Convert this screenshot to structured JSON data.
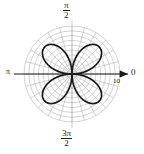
{
  "figure": {
    "type": "polar-plot",
    "background_color": "#ffffff",
    "curve_color": "#1a1a1a",
    "grid_color": "#b0b0b0",
    "axis_color": "#1a1a1a"
  },
  "labels": {
    "top_numerator": "π",
    "top_denominator": "2",
    "bottom_numerator": "3π",
    "bottom_denominator": "2",
    "left": "π",
    "right_angle": "0",
    "radial_tick": "10"
  },
  "chart_data": {
    "type": "line",
    "title": "",
    "subtitle": "",
    "xlabel": "",
    "ylabel": "",
    "coordinate_system": "polar",
    "grid": true,
    "legend": null,
    "angle_tick_labels": [
      "0",
      "π/2",
      "π",
      "3π/2"
    ],
    "angle_tick_values_rad": [
      0,
      1.5707963,
      3.1415927,
      4.712389
    ],
    "radial_tick_labels": [
      "10"
    ],
    "radial_tick_values": [
      10
    ],
    "rlim": [
      0,
      10
    ],
    "radial_grid_circles": 10,
    "angular_grid_spokes": 24,
    "series": [
      {
        "name": "four-petal rose",
        "equation": "r = 8 sin(2θ)",
        "amplitude": 8,
        "petal_count": 4,
        "petal_angles_deg": [
          45,
          135,
          225,
          315
        ],
        "r_max": 8,
        "theta_range_deg": [
          0,
          360
        ],
        "points_theta_deg": [
          0,
          10,
          20,
          30,
          40,
          45,
          50,
          60,
          70,
          80,
          90,
          100,
          110,
          120,
          130,
          135,
          140,
          150,
          160,
          170,
          180
        ],
        "points_r": [
          0,
          2.74,
          5.14,
          6.93,
          7.88,
          8.0,
          7.88,
          6.93,
          5.14,
          2.74,
          0,
          2.74,
          5.14,
          6.93,
          7.88,
          8.0,
          7.88,
          6.93,
          5.14,
          2.74,
          0
        ]
      }
    ]
  }
}
